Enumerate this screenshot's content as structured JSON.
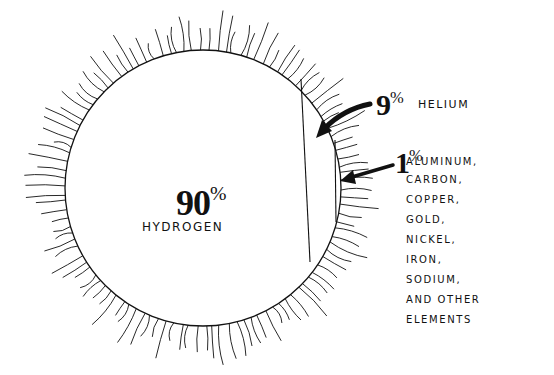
{
  "diagram": {
    "segments": [
      {
        "name": "hydrogen",
        "percent": 90,
        "percent_label": "90",
        "label": "HYDROGEN"
      },
      {
        "name": "helium",
        "percent": 9,
        "percent_label": "9",
        "label": "HELIUM"
      },
      {
        "name": "other",
        "percent": 1,
        "percent_label": "1",
        "label_items": [
          "ALUMINUM,",
          "CARBON,",
          "COPPER,",
          "GOLD,",
          "NICKEL,",
          "IRON,",
          "SODIUM,",
          "AND OTHER",
          "ELEMENTS"
        ]
      }
    ],
    "percent_symbol": "%",
    "colors": {
      "ink": "#111111",
      "background": "#ffffff"
    }
  }
}
